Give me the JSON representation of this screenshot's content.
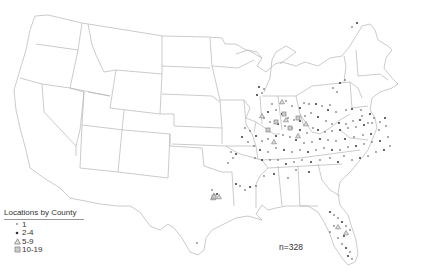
{
  "legend": {
    "title": "Locations by County",
    "items": [
      {
        "label": "1",
        "symbol": "small-dot"
      },
      {
        "label": "2-4",
        "symbol": "dot"
      },
      {
        "label": "5-9",
        "symbol": "triangle"
      },
      {
        "label": "10-19",
        "symbol": "square"
      }
    ]
  },
  "sample_size": "n=328",
  "colors": {
    "outline": "#b4b4b4",
    "marker": "#444444",
    "marker_light": "#888888"
  },
  "points": [
    [
      357,
      23
    ],
    [
      352,
      27
    ],
    [
      345,
      80
    ],
    [
      340,
      83
    ],
    [
      333,
      88
    ],
    [
      337,
      92
    ],
    [
      259,
      87
    ],
    [
      264,
      89
    ],
    [
      262,
      93
    ],
    [
      257,
      95
    ],
    [
      286,
      101
    ],
    [
      292,
      106
    ],
    [
      300,
      108
    ],
    [
      304,
      103
    ],
    [
      309,
      104
    ],
    [
      316,
      104
    ],
    [
      322,
      106
    ],
    [
      330,
      105
    ],
    [
      328,
      110
    ],
    [
      336,
      112
    ],
    [
      346,
      110
    ],
    [
      352,
      109
    ],
    [
      361,
      110
    ],
    [
      362,
      116
    ],
    [
      370,
      114
    ],
    [
      374,
      118
    ],
    [
      368,
      123
    ],
    [
      360,
      120
    ],
    [
      353,
      121
    ],
    [
      346,
      124
    ],
    [
      339,
      123
    ],
    [
      332,
      124
    ],
    [
      326,
      121
    ],
    [
      318,
      117
    ],
    [
      311,
      113
    ],
    [
      305,
      116
    ],
    [
      300,
      121
    ],
    [
      294,
      120
    ],
    [
      288,
      118
    ],
    [
      282,
      114
    ],
    [
      276,
      110
    ],
    [
      272,
      104
    ],
    [
      268,
      112
    ],
    [
      264,
      118
    ],
    [
      270,
      122
    ],
    [
      278,
      124
    ],
    [
      285,
      126
    ],
    [
      292,
      128
    ],
    [
      300,
      130
    ],
    [
      307,
      133
    ],
    [
      313,
      128
    ],
    [
      318,
      130
    ],
    [
      325,
      132
    ],
    [
      332,
      131
    ],
    [
      340,
      130
    ],
    [
      348,
      128
    ],
    [
      356,
      127
    ],
    [
      364,
      125
    ],
    [
      372,
      123
    ],
    [
      380,
      122
    ],
    [
      385,
      118
    ],
    [
      386,
      126
    ],
    [
      379,
      130
    ],
    [
      371,
      134
    ],
    [
      363,
      135
    ],
    [
      354,
      137
    ],
    [
      345,
      139
    ],
    [
      336,
      141
    ],
    [
      328,
      140
    ],
    [
      320,
      139
    ],
    [
      312,
      142
    ],
    [
      304,
      143
    ],
    [
      296,
      140
    ],
    [
      290,
      137
    ],
    [
      283,
      135
    ],
    [
      276,
      136
    ],
    [
      268,
      139
    ],
    [
      262,
      141
    ],
    [
      256,
      136
    ],
    [
      250,
      131
    ],
    [
      245,
      128
    ],
    [
      242,
      137
    ],
    [
      248,
      142
    ],
    [
      254,
      146
    ],
    [
      260,
      150
    ],
    [
      268,
      152
    ],
    [
      276,
      148
    ],
    [
      284,
      150
    ],
    [
      292,
      152
    ],
    [
      300,
      150
    ],
    [
      308,
      152
    ],
    [
      316,
      150
    ],
    [
      324,
      148
    ],
    [
      332,
      150
    ],
    [
      340,
      150
    ],
    [
      348,
      147
    ],
    [
      356,
      146
    ],
    [
      364,
      144
    ],
    [
      372,
      142
    ],
    [
      380,
      141
    ],
    [
      388,
      137
    ],
    [
      390,
      146
    ],
    [
      384,
      150
    ],
    [
      376,
      152
    ],
    [
      368,
      156
    ],
    [
      360,
      158
    ],
    [
      352,
      160
    ],
    [
      344,
      156
    ],
    [
      338,
      162
    ],
    [
      330,
      158
    ],
    [
      320,
      160
    ],
    [
      311,
      162
    ],
    [
      302,
      160
    ],
    [
      294,
      162
    ],
    [
      286,
      164
    ],
    [
      278,
      160
    ],
    [
      270,
      160
    ],
    [
      262,
      160
    ],
    [
      255,
      158
    ],
    [
      231,
      152
    ],
    [
      236,
      154
    ],
    [
      233,
      158
    ],
    [
      228,
      163
    ],
    [
      236,
      184
    ],
    [
      240,
      186
    ],
    [
      245,
      190
    ],
    [
      250,
      187
    ],
    [
      256,
      186
    ],
    [
      264,
      176
    ],
    [
      274,
      174
    ],
    [
      288,
      178
    ],
    [
      296,
      170
    ],
    [
      309,
      172
    ],
    [
      212,
      190
    ],
    [
      214,
      194
    ],
    [
      217,
      194
    ],
    [
      212,
      198
    ],
    [
      197,
      243
    ],
    [
      330,
      212
    ],
    [
      334,
      215
    ],
    [
      338,
      218
    ],
    [
      342,
      222
    ],
    [
      346,
      226
    ],
    [
      350,
      230
    ],
    [
      344,
      236
    ],
    [
      338,
      238
    ],
    [
      342,
      244
    ],
    [
      346,
      248
    ],
    [
      350,
      252
    ],
    [
      352,
      259
    ],
    [
      348,
      256
    ],
    [
      334,
      226
    ],
    [
      330,
      232
    ]
  ],
  "triangles": [
    [
      213,
      198
    ],
    [
      219,
      197
    ],
    [
      338,
      227
    ],
    [
      346,
      233
    ],
    [
      286,
      120
    ],
    [
      298,
      136
    ],
    [
      274,
      142
    ],
    [
      262,
      116
    ],
    [
      282,
      102
    ],
    [
      306,
      124
    ]
  ],
  "squares": [
    [
      276,
      122
    ],
    [
      284,
      114
    ],
    [
      290,
      128
    ],
    [
      268,
      130
    ],
    [
      298,
      118
    ],
    [
      214,
      197
    ]
  ]
}
